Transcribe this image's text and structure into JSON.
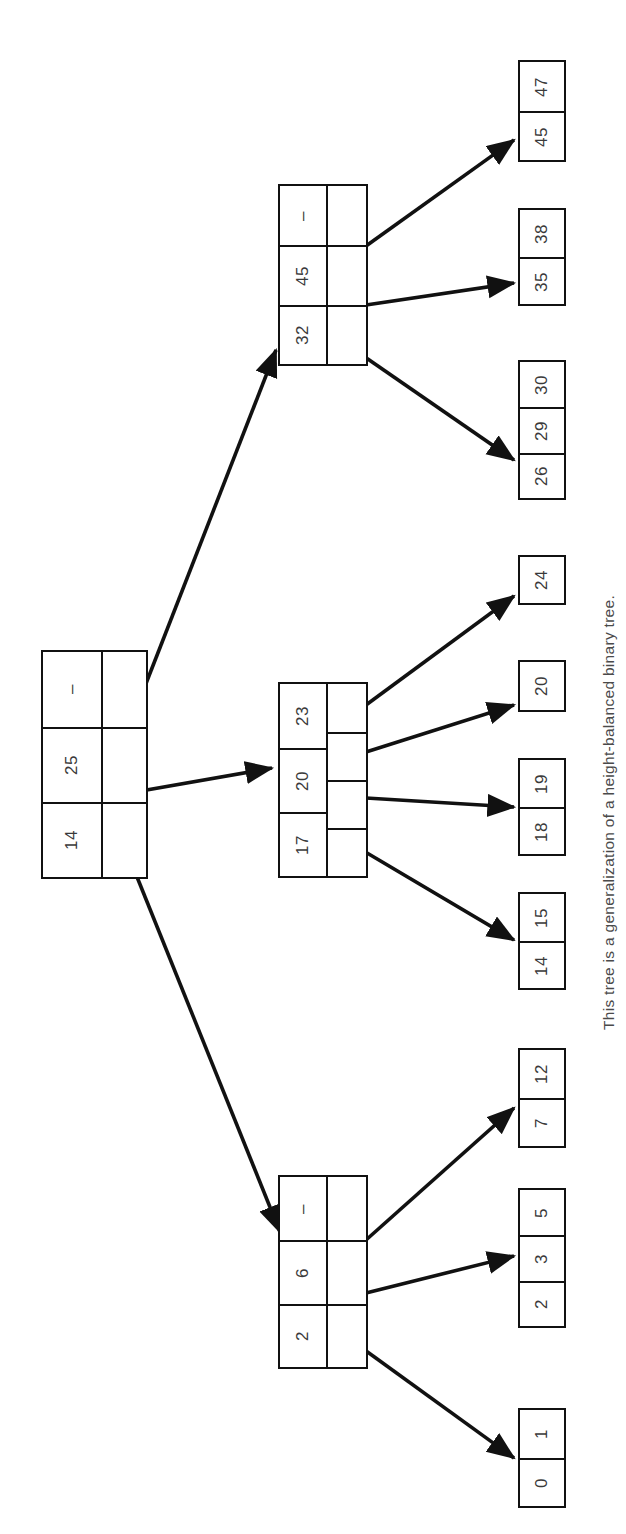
{
  "figure": {
    "caption": "This tree is a generalization of a height-balanced binary tree.",
    "type": "b-tree-diagram",
    "ink_color": "#111111",
    "text_color": "#3a3a3a",
    "background_color": "#ffffff"
  },
  "tree": {
    "root": {
      "id": "root",
      "keys": [
        "14",
        "25",
        "–"
      ],
      "pointer_count": 3
    },
    "internal": [
      {
        "id": "internal-upper",
        "keys": [
          "32",
          "45",
          "–"
        ],
        "pointer_count": 3
      },
      {
        "id": "internal-middle",
        "keys": [
          "17",
          "20",
          "23"
        ],
        "pointer_count": 4
      },
      {
        "id": "internal-lower",
        "keys": [
          "2",
          "6",
          "–"
        ],
        "pointer_count": 3
      }
    ],
    "leaves": [
      {
        "id": "leaf-45-47",
        "values": [
          "45",
          "47"
        ]
      },
      {
        "id": "leaf-35-38",
        "values": [
          "35",
          "38"
        ]
      },
      {
        "id": "leaf-26-29-30",
        "values": [
          "26",
          "29",
          "30"
        ]
      },
      {
        "id": "leaf-24",
        "values": [
          "24"
        ]
      },
      {
        "id": "leaf-20",
        "values": [
          "20"
        ]
      },
      {
        "id": "leaf-18-19",
        "values": [
          "18",
          "19"
        ]
      },
      {
        "id": "leaf-14-15",
        "values": [
          "14",
          "15"
        ]
      },
      {
        "id": "leaf-7-12",
        "values": [
          "7",
          "12"
        ]
      },
      {
        "id": "leaf-2-3-5",
        "values": [
          "2",
          "3",
          "5"
        ]
      },
      {
        "id": "leaf-0-1",
        "values": [
          "0",
          "1"
        ]
      }
    ]
  },
  "labels": {
    "root_key_0": "14",
    "root_key_1": "25",
    "root_key_2": "–",
    "upper_key_0": "32",
    "upper_key_1": "45",
    "upper_key_2": "–",
    "middle_key_0": "17",
    "middle_key_1": "20",
    "middle_key_2": "23",
    "lower_key_0": "2",
    "lower_key_1": "6",
    "lower_key_2": "–",
    "leaf_45_47_0": "45",
    "leaf_45_47_1": "47",
    "leaf_35_38_0": "35",
    "leaf_35_38_1": "38",
    "leaf_26_29_30_0": "26",
    "leaf_26_29_30_1": "29",
    "leaf_26_29_30_2": "30",
    "leaf_24_0": "24",
    "leaf_20_0": "20",
    "leaf_18_19_0": "18",
    "leaf_18_19_1": "19",
    "leaf_14_15_0": "14",
    "leaf_14_15_1": "15",
    "leaf_7_12_0": "7",
    "leaf_7_12_1": "12",
    "leaf_2_3_5_0": "2",
    "leaf_2_3_5_1": "3",
    "leaf_2_3_5_2": "5",
    "leaf_0_1_0": "0",
    "leaf_0_1_1": "1"
  }
}
